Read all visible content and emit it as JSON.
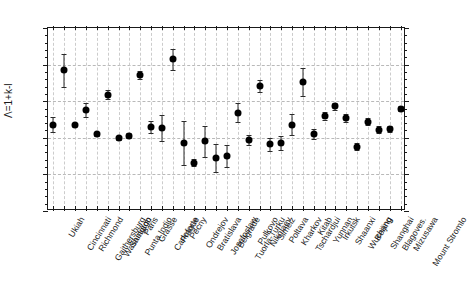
{
  "chart_data": {
    "type": "scatter",
    "title": "",
    "subtitle": "",
    "xlabel": "",
    "ylabel": "Λ=1+k-l",
    "ylim": [
      0.0,
      2.5
    ],
    "ytick_labels": [
      "0.0",
      "0.5",
      "1.0",
      "1.5",
      "2.0",
      "2.5"
    ],
    "ytick_values": [
      0.0,
      0.5,
      1.0,
      1.5,
      2.0,
      2.5
    ],
    "yminor_step": 0.1,
    "grid": "dashed-both",
    "legend": "none",
    "errorbars": true,
    "marker": "filled-circle",
    "marker_color": "#000000",
    "categories": [
      "Ukiah",
      "Cincinnati",
      "Richmond",
      "Gaithersburg",
      "Washington",
      "Santiago",
      "Punta Indio",
      "Paris",
      "Grasse",
      "Carloforte",
      "Prague",
      "Pecny",
      "Ondrejov",
      "Bratislava",
      "Josefoslaw",
      "Belgrade",
      "Tuorla-Turku",
      "Pulkovo",
      "Nikolaev",
      "Simeiz",
      "Poltava",
      "Kharkov",
      "Tschardjui",
      "Kitab",
      "Yunnan",
      "Irkutsk",
      "Shaanxi",
      "Wuchang",
      "Beijing",
      "Shanghai",
      "Blagoves.",
      "Mizusawa",
      "Mount Stromlo"
    ],
    "values": [
      1.18,
      1.92,
      1.18,
      1.38,
      1.05,
      1.59,
      1.0,
      1.03,
      1.86,
      1.15,
      1.13,
      2.07,
      0.93,
      0.66,
      0.95,
      0.72,
      0.75,
      1.34,
      0.97,
      1.71,
      0.91,
      0.93,
      1.18,
      1.76,
      1.05,
      1.3,
      1.43,
      1.27,
      0.88,
      1.22,
      1.11,
      1.12,
      1.4
    ],
    "errors": [
      0.1,
      0.23,
      0.0,
      0.09,
      0.03,
      0.06,
      0.03,
      0.03,
      0.05,
      0.08,
      0.18,
      0.14,
      0.3,
      0.05,
      0.21,
      0.19,
      0.15,
      0.13,
      0.07,
      0.08,
      0.09,
      0.1,
      0.14,
      0.19,
      0.07,
      0.05,
      0.05,
      0.05,
      0.05,
      0.05,
      0.05,
      0.04,
      0.04
    ]
  },
  "figure": {
    "background": "#ffffff",
    "axis_color": "#1a1a1a",
    "grid_color": "#b9b9b9"
  }
}
